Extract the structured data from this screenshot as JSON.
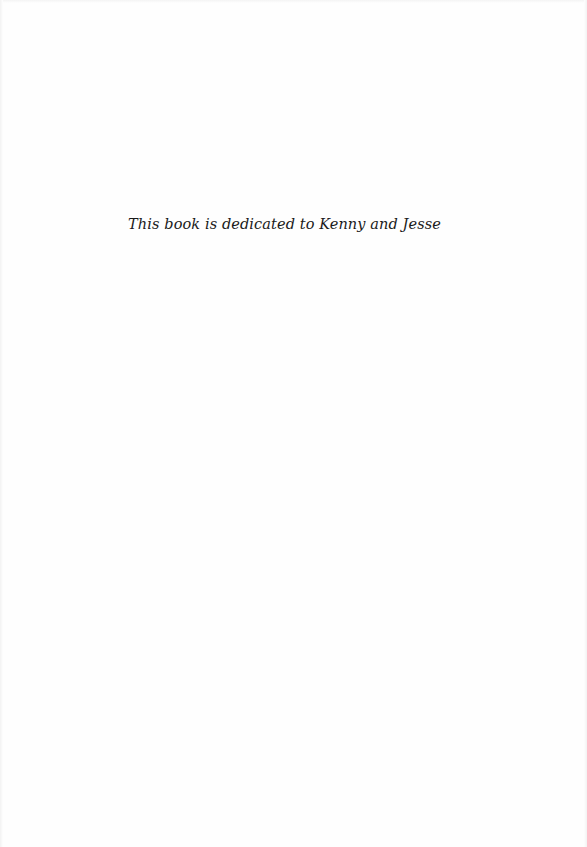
{
  "page": {
    "dedication": "This book is dedicated to Kenny and Jesse",
    "background_color": "#fefefe",
    "text_color": "#1a1a1a"
  }
}
